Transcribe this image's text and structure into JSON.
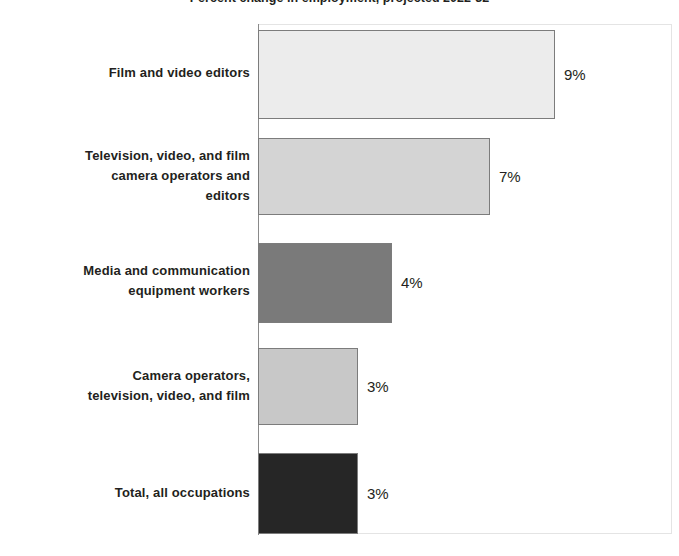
{
  "chart_data": {
    "type": "bar",
    "orientation": "horizontal",
    "title": "Percent change in employment, projected 2022-32",
    "xlabel": "",
    "ylabel": "",
    "grid": false,
    "legend": null,
    "xlim": [
      0,
      12.5
    ],
    "categories": [
      "Film and video editors",
      "Television, video, and film camera operators and editors",
      "Media and communication equipment workers",
      "Camera operators, television, video, and film",
      "Total, all occupations"
    ],
    "values": [
      9,
      7,
      4,
      3,
      3
    ],
    "value_labels": [
      "9%",
      "7%",
      "4%",
      "3%",
      "3%"
    ],
    "bar_colors": [
      "#ececec",
      "#d4d4d4",
      "#7a7a7a",
      "#c8c8c8",
      "#262626"
    ],
    "bar_border_color": "#7c7c7c",
    "axis_color": "#8a8a8a"
  },
  "bars": [
    {
      "label_lines": [
        "Film and video editors"
      ],
      "value_label": "9%",
      "value": 9,
      "color": "#ececec",
      "top": 30,
      "height": 89,
      "width": 297,
      "label_top": 63
    },
    {
      "label_lines": [
        "Television, video, and film",
        "camera operators and",
        "editors"
      ],
      "value_label": "7%",
      "value": 7,
      "color": "#d4d4d4",
      "top": 138,
      "height": 77,
      "width": 232,
      "label_top": 146
    },
    {
      "label_lines": [
        "Media and communication",
        "equipment workers"
      ],
      "value_label": "4%",
      "value": 4,
      "color": "#7a7a7a",
      "top": 243,
      "height": 80,
      "width": 134,
      "label_top": 261
    },
    {
      "label_lines": [
        "Camera operators,",
        "television, video, and film"
      ],
      "value_label": "3%",
      "value": 3,
      "color": "#c8c8c8",
      "top": 348,
      "height": 77,
      "width": 100,
      "label_top": 366
    },
    {
      "label_lines": [
        "Total, all occupations"
      ],
      "value_label": "3%",
      "value": 3,
      "color": "#262626",
      "top": 453,
      "height": 81,
      "width": 100,
      "label_top": 483
    }
  ]
}
